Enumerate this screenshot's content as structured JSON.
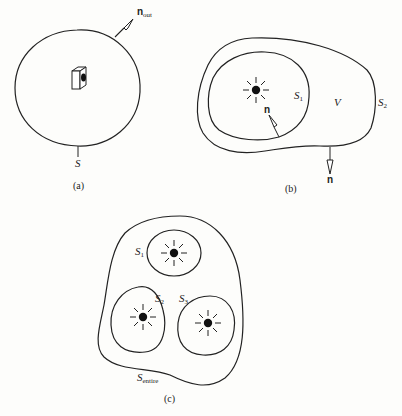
{
  "panel_a": {
    "surface_label": "S",
    "normal_label": "n",
    "normal_sub": "out",
    "caption": "(a)"
  },
  "panel_b": {
    "inner_surface": "S",
    "inner_sub": "1",
    "volume_label": "V",
    "outer_surface": "S",
    "outer_sub": "2",
    "normal_inner": "n",
    "normal_outer": "n",
    "caption": "(b)"
  },
  "panel_c": {
    "s1": "S",
    "s1_sub": "1",
    "s2": "S",
    "s2_sub": "2",
    "s3": "S",
    "s3_sub": "3",
    "entire": "S",
    "entire_sub": "entire",
    "caption": "(c)"
  },
  "colors": {
    "ink": "#222222",
    "background": "#fdfdfb"
  }
}
